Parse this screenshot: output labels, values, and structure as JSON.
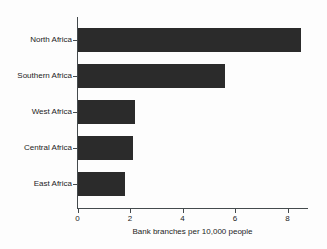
{
  "chart_data": {
    "type": "bar",
    "orientation": "horizontal",
    "title": "",
    "xlabel": "Bank branches per 10,000 people",
    "ylabel": "",
    "categories": [
      "North Africa",
      "Southern Africa",
      "West Africa",
      "Central Africa",
      "East Africa"
    ],
    "values": [
      8.5,
      5.6,
      2.2,
      2.1,
      1.8
    ],
    "xticks": [
      0,
      2,
      4,
      6,
      8
    ],
    "xtick_labels": [
      "0",
      "2",
      "4",
      "6",
      "8"
    ],
    "xlim": [
      0,
      8.76
    ],
    "grid": false,
    "legend": null,
    "bar_color": "#2b2b2b",
    "axis_color": "#444a4d",
    "background_color": "#fdfdfd"
  },
  "axis": {
    "x_title": "Bank branches per 10,000 people"
  }
}
